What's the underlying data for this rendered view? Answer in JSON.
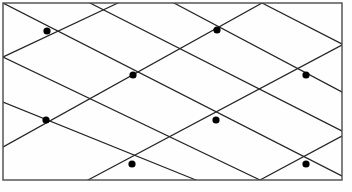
{
  "figure": {
    "type": "geometric-diagram",
    "canvas": {
      "width": 352,
      "height": 192
    },
    "background_color": "#fefefe",
    "stroke_color": "#262626",
    "frame_color": "#4a4a4a",
    "point_color": "#000000"
  },
  "frame": {
    "name": "bounding-rectangle",
    "x": 3,
    "y": 3,
    "width": 339,
    "height": 177,
    "stroke_width": 1.4
  },
  "lattice": {
    "description": "Two families of parallel straight lines forming a diamond/rhombus tiling clipped by the rectangle",
    "line_stroke_width": 1.2,
    "family_a": {
      "name": "down-right-lines",
      "direction": "descending to the right",
      "slope": 0.512,
      "count": 5,
      "lines": [
        {
          "x1": 3,
          "y1": 3,
          "x2": 342,
          "y2": 176
        },
        {
          "x1": 3,
          "y1": 102,
          "x2": 196,
          "y2": 180
        },
        {
          "x1": 90,
          "y1": 3,
          "x2": 342,
          "y2": 131
        },
        {
          "x1": 262,
          "y1": 3,
          "x2": 342,
          "y2": 44
        },
        {
          "x1": 3,
          "y1": 57,
          "x2": 260,
          "y2": 180
        }
      ]
    },
    "family_b": {
      "name": "up-right-lines",
      "direction": "ascending to the right",
      "slope": -0.512,
      "count": 5,
      "lines": [
        {
          "x1": 3,
          "y1": 57,
          "x2": 118,
          "y2": 3
        },
        {
          "x1": 3,
          "y1": 147,
          "x2": 262,
          "y2": 3
        },
        {
          "x1": 88,
          "y1": 180,
          "x2": 342,
          "y2": 45
        },
        {
          "x1": 260,
          "y1": 180,
          "x2": 342,
          "y2": 136
        },
        {
          "x1": 174,
          "y1": 3,
          "x2": 342,
          "y2": 92
        }
      ]
    }
  },
  "points": {
    "name": "lattice-nodes",
    "radius": 3.6,
    "count": 8,
    "items": [
      {
        "id": "node-1",
        "label": "upper-left",
        "x": 47,
        "y": 31
      },
      {
        "id": "node-2",
        "label": "upper-middle",
        "x": 217,
        "y": 30
      },
      {
        "id": "node-3",
        "label": "center",
        "x": 133,
        "y": 75
      },
      {
        "id": "node-4",
        "label": "center-right",
        "x": 306,
        "y": 75
      },
      {
        "id": "node-5",
        "label": "middle-left",
        "x": 46,
        "y": 120
      },
      {
        "id": "node-6",
        "label": "middle-right",
        "x": 216,
        "y": 120
      },
      {
        "id": "node-7",
        "label": "lower-middle",
        "x": 132,
        "y": 164
      },
      {
        "id": "node-8",
        "label": "lower-right",
        "x": 306,
        "y": 164
      }
    ]
  }
}
